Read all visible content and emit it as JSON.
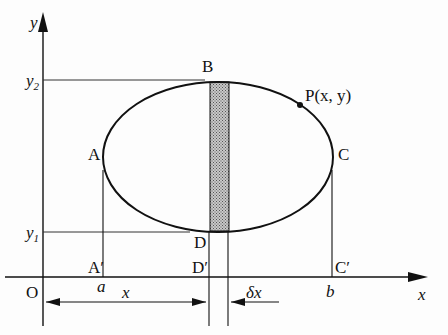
{
  "figure": {
    "type": "area-by-strips diagram of an ellipse",
    "axes": {
      "x_label": "x",
      "y_label": "y",
      "origin_label": "O"
    },
    "y_ticks": [
      {
        "base": "y",
        "sub": "2"
      },
      {
        "base": "y",
        "sub": "1"
      }
    ],
    "x_ticks": [
      "a",
      "b"
    ],
    "points": {
      "A": "A",
      "B": "B",
      "C": "C",
      "D": "D",
      "A_prime": "A′",
      "C_prime": "C′",
      "D_prime": "D′",
      "P": "P(x, y)"
    },
    "dimensions": {
      "x_span": "x",
      "strip_width": "δx"
    },
    "colors": {
      "line": "#111111",
      "strip_fill": "#a9a9a9",
      "background": "#fdfdfd"
    }
  }
}
